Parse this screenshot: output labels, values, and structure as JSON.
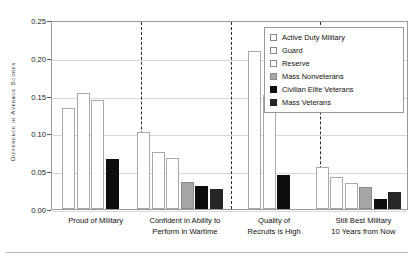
{
  "chart_data": {
    "type": "bar",
    "title": "",
    "xlabel": "",
    "ylabel": "Difference in Average Scores",
    "ylim": [
      0.0,
      0.25
    ],
    "ytick_labels": [
      "0.25",
      "0.20",
      "0.15",
      "0.10",
      "0.05",
      "0.00"
    ],
    "ytick_values": [
      0.25,
      0.2,
      0.15,
      0.1,
      0.05,
      0.0
    ],
    "grid": true,
    "legend_position": "top-right",
    "categories": [
      "Proud of Military",
      "Confident in Ability to Perform in Wartime",
      "Quality of Recruits is High",
      "Still Best Military 10 Years from Now"
    ],
    "category_lines": [
      [
        "Proud of Military"
      ],
      [
        "Confident in Ability to",
        "Perform in Wartime"
      ],
      [
        "Quality of",
        "Recruits is High"
      ],
      [
        "Still Best Military",
        "10 Years from Now"
      ]
    ],
    "series": [
      {
        "name": "Active Duty Military",
        "color": "#ffffff",
        "values": [
          0.133,
          0.102,
          0.209,
          0.055
        ]
      },
      {
        "name": "Guard",
        "color": "#ffffff",
        "values": [
          0.153,
          0.076,
          0.151,
          0.042
        ]
      },
      {
        "name": "Reserve",
        "color": "#ffffff",
        "values": [
          0.144,
          0.067,
          null,
          0.034
        ]
      },
      {
        "name": "Mass Nonveterans",
        "color": "#a6a6a6",
        "values": [
          null,
          0.036,
          null,
          0.029
        ]
      },
      {
        "name": "Civilian Elite Veterans",
        "color": "#0d0d0d",
        "values": [
          0.066,
          0.03,
          0.045,
          0.013
        ]
      },
      {
        "name": "Mass Veterans",
        "color": "#262626",
        "values": [
          null,
          0.027,
          null,
          0.022
        ]
      }
    ]
  },
  "legend": {
    "items": [
      {
        "label": "Active Duty Military"
      },
      {
        "label": "Guard"
      },
      {
        "label": "Reserve"
      },
      {
        "label": "Mass Nonveterans"
      },
      {
        "label": "Civilian Elite Veterans"
      },
      {
        "label": "Mass Veterans"
      }
    ]
  }
}
